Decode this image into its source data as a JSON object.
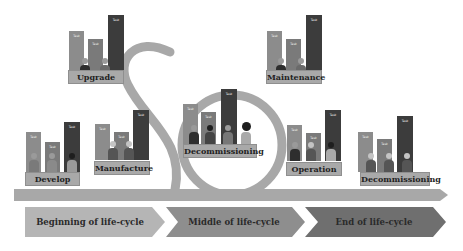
{
  "diagram": {
    "stages": [
      {
        "id": "upgrade",
        "label": "Upgrade",
        "bars": [
          "Task",
          "Task",
          "Task"
        ]
      },
      {
        "id": "maintenance",
        "label": "Maintenance",
        "bars": [
          "Task",
          "Task",
          "Task"
        ]
      },
      {
        "id": "develop",
        "label": "Develop",
        "bars": [
          "Task",
          "Task",
          "Task"
        ]
      },
      {
        "id": "manufacture",
        "label": "Manufacture",
        "bars": [
          "Task",
          "Task",
          "Task"
        ]
      },
      {
        "id": "decommissioning-center",
        "label": "Decommissioning",
        "bars": [
          "Task",
          "Task",
          "Task"
        ]
      },
      {
        "id": "operation",
        "label": "Operation",
        "bars": [
          "Task",
          "Task",
          "Task"
        ]
      },
      {
        "id": "decommissioning-end",
        "label": "Decommissioning",
        "bars": [
          "Task",
          "Task",
          "Task"
        ]
      }
    ],
    "phases": [
      {
        "label": "Beginning of life-cycle",
        "color": "#b5b5b5"
      },
      {
        "label": "Middle of life-cycle",
        "color": "#8e8e8e"
      },
      {
        "label": "End of life-cycle",
        "color": "#6f6f6f"
      }
    ],
    "colors": {
      "track": "#a8a8a8",
      "bar_light": "#8c8c8c",
      "bar_mid": "#7a7a7a",
      "bar_dark": "#3c3c3c",
      "label_bg": "#a9a9a9"
    }
  }
}
